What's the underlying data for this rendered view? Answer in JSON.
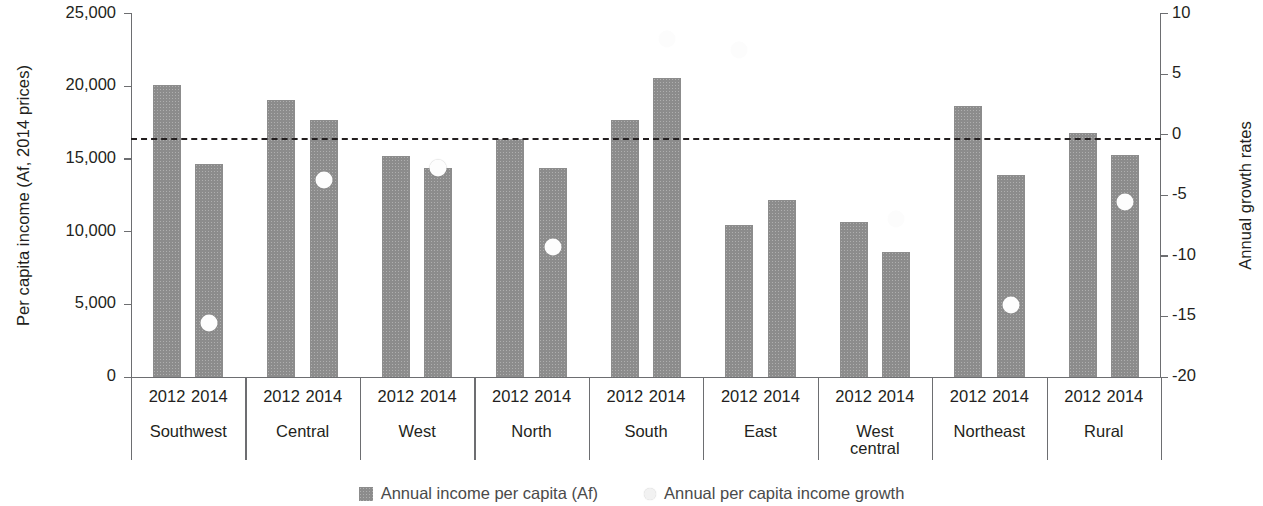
{
  "chart_data": {
    "type": "bar",
    "title": "",
    "xlabel": "",
    "ylabel": "Per capita income (Af, 2014 prices)",
    "ylabel_right": "Annual growth rates",
    "ylim": [
      0,
      25000
    ],
    "ylim_right": [
      -20,
      10
    ],
    "yticks": [
      "0",
      "5,000",
      "10,000",
      "15,000",
      "20,000",
      "25,000"
    ],
    "yticks_right": [
      "-20",
      "-15",
      "-10",
      "-5",
      "0",
      "5",
      "10"
    ],
    "grid": false,
    "legend_position": "bottom",
    "reference_line": {
      "value_right_axis": 0,
      "style": "dashed",
      "label": ""
    },
    "categories": [
      "Southwest",
      "Central",
      "West",
      "North",
      "South",
      "East",
      "West central",
      "Northeast",
      "Rural"
    ],
    "sub_categories": [
      "2012",
      "2014"
    ],
    "series": [
      {
        "name": "Annual income per capita (Af)",
        "type": "bar",
        "axis": "left",
        "values_2012": [
          20100,
          19100,
          15200,
          16400,
          17700,
          10500,
          10700,
          18700,
          16800
        ],
        "values_2014": [
          14700,
          17700,
          14400,
          14400,
          20600,
          12200,
          8600,
          13900,
          15300
        ]
      },
      {
        "name": "Annual per capita income growth",
        "type": "scatter",
        "axis": "right",
        "values_2012": [
          null,
          null,
          null,
          null,
          null,
          7.0,
          null,
          null,
          null
        ],
        "values_2014": [
          -15.5,
          -3.7,
          -2.7,
          -9.2,
          7.9,
          null,
          -6.9,
          -14.0,
          -5.5
        ]
      }
    ]
  },
  "axes": {
    "left": {
      "title": "Per capita income (Af, 2014 prices)",
      "ticks": [
        {
          "label": "25,000",
          "value": 25000
        },
        {
          "label": "20,000",
          "value": 20000
        },
        {
          "label": "15,000",
          "value": 15000
        },
        {
          "label": "10,000",
          "value": 10000
        },
        {
          "label": "5,000",
          "value": 5000
        },
        {
          "label": "0",
          "value": 0
        }
      ]
    },
    "right": {
      "title": "Annual growth rates",
      "ticks": [
        {
          "label": "10",
          "value": 10
        },
        {
          "label": "5",
          "value": 5
        },
        {
          "label": "0",
          "value": 0
        },
        {
          "label": "-5",
          "value": -5
        },
        {
          "label": "-10",
          "value": -10
        },
        {
          "label": "-15",
          "value": -15
        },
        {
          "label": "-20",
          "value": -20
        }
      ]
    }
  },
  "groups": [
    {
      "label": "Southwest",
      "years": [
        "2012",
        "2014"
      ]
    },
    {
      "label": "Central",
      "years": [
        "2012",
        "2014"
      ]
    },
    {
      "label": "West",
      "years": [
        "2012",
        "2014"
      ]
    },
    {
      "label": "North",
      "years": [
        "2012",
        "2014"
      ]
    },
    {
      "label": "South",
      "years": [
        "2012",
        "2014"
      ]
    },
    {
      "label": "East",
      "years": [
        "2012",
        "2014"
      ]
    },
    {
      "label": "West\ncentral",
      "years": [
        "2012",
        "2014"
      ]
    },
    {
      "label": "Northeast",
      "years": [
        "2012",
        "2014"
      ]
    },
    {
      "label": "Rural",
      "years": [
        "2012",
        "2014"
      ]
    }
  ],
  "legend": {
    "items": [
      {
        "label": "Annual income per capita (Af)",
        "marker": "bar-swatch",
        "color": "#8c8c8c"
      },
      {
        "label": "Annual per capita income growth",
        "marker": "circle-swatch",
        "color": "#f2f2f2"
      }
    ]
  }
}
